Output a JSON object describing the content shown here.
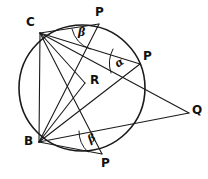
{
  "figure": {
    "kind": "circle-geometry-diagram",
    "canvas": {
      "width": 208,
      "height": 179
    },
    "stroke_color": "#1a1a1a",
    "background_color": "#ffffff",
    "circle": {
      "cx": 82,
      "cy": 88,
      "r": 63
    },
    "points": [
      {
        "id": "C",
        "label": "C",
        "x": 40,
        "y": 33,
        "label_x": 26,
        "label_y": 16
      },
      {
        "id": "P1",
        "label": "P",
        "x": 99,
        "y": 24,
        "label_x": 95,
        "label_y": 6
      },
      {
        "id": "P2",
        "label": "P",
        "x": 140,
        "y": 64,
        "label_x": 143,
        "label_y": 50
      },
      {
        "id": "P3",
        "label": "P",
        "x": 102,
        "y": 154,
        "label_x": 101,
        "label_y": 157
      },
      {
        "id": "B",
        "label": "B",
        "x": 39,
        "y": 142,
        "label_x": 24,
        "label_y": 135
      },
      {
        "id": "R",
        "label": "R",
        "x": 85,
        "y": 83,
        "label_x": 90,
        "label_y": 74
      },
      {
        "id": "Q",
        "label": "Q",
        "x": 189,
        "y": 113,
        "label_x": 192,
        "label_y": 104
      }
    ],
    "segments": [
      {
        "from": "C",
        "to": "B",
        "name": "chord-cb"
      },
      {
        "from": "C",
        "to": "P1",
        "name": "chord-c-p1"
      },
      {
        "from": "C",
        "to": "P2",
        "name": "chord-c-p2"
      },
      {
        "from": "C",
        "to": "P3",
        "name": "chord-c-p3"
      },
      {
        "from": "C",
        "to": "R",
        "name": "segment-c-r"
      },
      {
        "from": "C",
        "to": "Q",
        "name": "segment-c-q"
      },
      {
        "from": "B",
        "to": "P1",
        "name": "chord-b-p1"
      },
      {
        "from": "B",
        "to": "P2",
        "name": "chord-b-p2"
      },
      {
        "from": "B",
        "to": "P3",
        "name": "chord-b-p3"
      },
      {
        "from": "B",
        "to": "R",
        "name": "segment-b-r"
      },
      {
        "from": "B",
        "to": "Q",
        "name": "segment-b-q"
      }
    ],
    "angles": [
      {
        "id": "beta-top",
        "symbol": "β",
        "vertex": "P1",
        "label_x": 78,
        "label_y": 27,
        "rotation": "none"
      },
      {
        "id": "alpha-right",
        "symbol": "α",
        "vertex": "P2",
        "label_x": 115,
        "label_y": 57,
        "rotation": "rot-a"
      },
      {
        "id": "beta-bottom",
        "symbol": "β",
        "vertex": "P3",
        "label_x": 88,
        "label_y": 133,
        "rotation": "rot-b"
      }
    ]
  }
}
